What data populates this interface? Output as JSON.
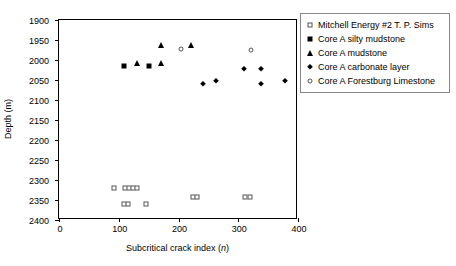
{
  "chart_data": {
    "type": "scatter",
    "title": "",
    "xlabel": "Subcritical crack index (n)",
    "xlabel_plain": "Subcritical crack index (",
    "xlabel_italic": "n",
    "xlabel_tail": ")",
    "ylabel": "Depth (m)",
    "xlim": [
      0,
      400
    ],
    "ylim": [
      2400,
      1900
    ],
    "y_inverted": true,
    "xticks": [
      0,
      100,
      200,
      300,
      400
    ],
    "yticks": [
      1900,
      1950,
      2000,
      2050,
      2100,
      2150,
      2200,
      2250,
      2300,
      2350,
      2400
    ],
    "grid": false,
    "legend_position": "right-top",
    "series": [
      {
        "name": "Mitchell Energy  #2 T. P. Sims",
        "marker": "open-square",
        "points": [
          {
            "x": 92,
            "y": 2320
          },
          {
            "x": 110,
            "y": 2320
          },
          {
            "x": 117,
            "y": 2320
          },
          {
            "x": 124,
            "y": 2320
          },
          {
            "x": 131,
            "y": 2320
          },
          {
            "x": 109,
            "y": 2360
          },
          {
            "x": 116,
            "y": 2360
          },
          {
            "x": 146,
            "y": 2360
          },
          {
            "x": 224,
            "y": 2343
          },
          {
            "x": 231,
            "y": 2343
          },
          {
            "x": 311,
            "y": 2343
          },
          {
            "x": 320,
            "y": 2343
          }
        ]
      },
      {
        "name": "Core A silty mudstone",
        "marker": "filled-square",
        "points": [
          {
            "x": 108,
            "y": 2015
          },
          {
            "x": 150,
            "y": 2015
          }
        ]
      },
      {
        "name": "Core A mudstone",
        "marker": "filled-triangle",
        "points": [
          {
            "x": 130,
            "y": 2007
          },
          {
            "x": 170,
            "y": 1962
          },
          {
            "x": 171,
            "y": 2007
          },
          {
            "x": 221,
            "y": 1962
          }
        ]
      },
      {
        "name": "Core A carbonate layer",
        "marker": "filled-diamond",
        "points": [
          {
            "x": 241,
            "y": 2061
          },
          {
            "x": 263,
            "y": 2052
          },
          {
            "x": 310,
            "y": 2022
          },
          {
            "x": 338,
            "y": 2022
          },
          {
            "x": 338,
            "y": 2061
          },
          {
            "x": 379,
            "y": 2052
          }
        ]
      },
      {
        "name": "Core A Forestburg Limestone",
        "marker": "open-circle",
        "points": [
          {
            "x": 204,
            "y": 1973
          },
          {
            "x": 322,
            "y": 1975
          }
        ]
      }
    ]
  },
  "legend": {
    "items": [
      {
        "label": "Mitchell Energy  #2 T. P. Sims",
        "marker": "open-square"
      },
      {
        "label": "Core A silty mudstone",
        "marker": "filled-square"
      },
      {
        "label": "Core A mudstone",
        "marker": "filled-triangle"
      },
      {
        "label": "Core A carbonate layer",
        "marker": "filled-diamond"
      },
      {
        "label": "Core A Forestburg Limestone",
        "marker": "open-circle"
      }
    ]
  }
}
